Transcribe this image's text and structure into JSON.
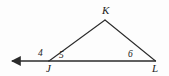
{
  "figure": {
    "kind": "geometry-diagram",
    "background_color": "#fdfdfd",
    "line_color": "#2b2b2b",
    "line_width": 1.1,
    "canvas": {
      "width": 169,
      "height": 76
    },
    "points": {
      "J": {
        "x": 49,
        "y": 61
      },
      "K": {
        "x": 105,
        "y": 20
      },
      "L": {
        "x": 155,
        "y": 61
      },
      "ray_tip": {
        "x": 5,
        "y": 61
      }
    },
    "segments": [
      {
        "name": "JK",
        "from": "J",
        "to": "K"
      },
      {
        "name": "KL",
        "from": "K",
        "to": "L"
      },
      {
        "name": "JL",
        "from": "J",
        "to": "L"
      },
      {
        "name": "ray-J-left",
        "from": "J",
        "to": "ray_tip",
        "arrow": "end"
      }
    ],
    "vertex_labels": [
      {
        "id": "K",
        "text": "K"
      },
      {
        "id": "J",
        "text": "J"
      },
      {
        "id": "L",
        "text": "L"
      }
    ],
    "angle_labels": [
      {
        "id": "4",
        "text": "4",
        "at": "J",
        "side": "exterior-left"
      },
      {
        "id": "5",
        "text": "5",
        "at": "J",
        "side": "interior"
      },
      {
        "id": "6",
        "text": "6",
        "at": "L",
        "side": "interior"
      }
    ]
  }
}
